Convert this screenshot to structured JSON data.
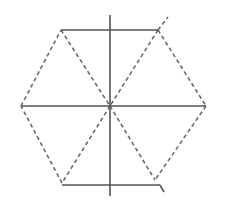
{
  "figure": {
    "description": "Hexagon constructed with dashed edges and dashed diagonals through a center point, with solid horizontal and vertical construction lines",
    "colors": {
      "background": "#ffffff",
      "line": "#555555",
      "dashed_line": "#6a6a6a"
    },
    "center": [
      110,
      106
    ],
    "hexagon_vertices": {
      "left": [
        21,
        106
      ],
      "top_left": [
        61,
        30
      ],
      "top_right": [
        158,
        30
      ],
      "right": [
        206,
        106
      ],
      "bottom_right": [
        155,
        180
      ],
      "bottom_left": [
        62,
        183
      ]
    },
    "solid_lines": [
      {
        "name": "top-horizontal-line",
        "from": [
          61,
          30
        ],
        "to": [
          158,
          30
        ]
      },
      {
        "name": "middle-horizontal-line",
        "from": [
          21,
          106
        ],
        "to": [
          206,
          106
        ]
      },
      {
        "name": "bottom-horizontal-line",
        "from": [
          62,
          185
        ],
        "to": [
          160,
          185
        ]
      },
      {
        "name": "vertical-axis-line",
        "from": [
          110,
          15
        ],
        "to": [
          110,
          196
        ]
      }
    ],
    "dashed_edges": [
      {
        "name": "edge-left-topleft",
        "from": [
          21,
          106
        ],
        "to": [
          61,
          30
        ]
      },
      {
        "name": "edge-topright-right",
        "from": [
          158,
          30
        ],
        "to": [
          206,
          106
        ]
      },
      {
        "name": "edge-right-bottomright",
        "from": [
          206,
          106
        ],
        "to": [
          155,
          180
        ]
      },
      {
        "name": "edge-bottomleft-left",
        "from": [
          62,
          183
        ],
        "to": [
          21,
          106
        ]
      }
    ],
    "dashed_diagonals": [
      {
        "name": "diagonal-topleft-center",
        "from": [
          61,
          30
        ],
        "to": [
          110,
          106
        ]
      },
      {
        "name": "diagonal-topright-center",
        "from": [
          158,
          30
        ],
        "to": [
          110,
          106
        ]
      },
      {
        "name": "diagonal-center-bottomleft",
        "from": [
          110,
          106
        ],
        "to": [
          62,
          183
        ]
      },
      {
        "name": "diagonal-center-bottomright",
        "from": [
          110,
          106
        ],
        "to": [
          155,
          180
        ]
      }
    ],
    "extensions": [
      {
        "name": "topright-extension",
        "from": [
          158,
          30
        ],
        "to": [
          168,
          17
        ]
      },
      {
        "name": "bottom-line-hook",
        "from": [
          160,
          185
        ],
        "to": [
          164,
          192
        ]
      }
    ]
  }
}
